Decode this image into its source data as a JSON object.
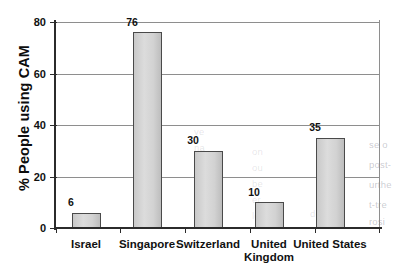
{
  "chart_data": {
    "type": "bar",
    "title": "",
    "xlabel": "",
    "ylabel": "% People using CAM",
    "categories": [
      "Israel",
      "Singapore",
      "Switzerland",
      "United\nKingdom",
      "United States"
    ],
    "values": [
      6,
      76,
      30,
      10,
      35
    ],
    "value_labels": [
      "6",
      "76",
      "30",
      "10",
      "35"
    ],
    "ylim": [
      0,
      80
    ],
    "yticks": [
      0,
      20,
      40,
      60,
      80
    ],
    "ytick_labels": [
      "0",
      "20",
      "40",
      "60",
      "80"
    ],
    "grid": "horizontal",
    "legend": "none",
    "bar_color": "#d2d2d2",
    "bar_edge_color": "#4a4a4a",
    "axis_color": "#2b2b2b",
    "gridline_color": "#8e8e8e",
    "background": "#ffffff"
  },
  "artifacts": {
    "bleed_through_note": "faint reversed text showing through scanned page",
    "fragments": [
      "se o",
      "post-",
      "urthe",
      "t-tre",
      "rosi",
      "me",
      "an",
      "bo",
      "of",
      "un",
      "ve",
      "le"
    ]
  }
}
